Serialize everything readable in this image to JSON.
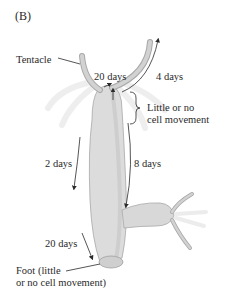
{
  "figure": {
    "panel_label": "(B)",
    "labels": {
      "tentacle": "Tentacle",
      "head_left_days": "20 days",
      "tentacle_right_days": "4 days",
      "little_movement_line1": "Little or no",
      "little_movement_line2": "cell movement",
      "body_left_days": "2 days",
      "body_right_days": "8 days",
      "lower_days": "20 days",
      "foot_line1": "Foot (little",
      "foot_line2": "or no cell movement)"
    },
    "colors": {
      "body_fill": "#dcdcdc",
      "body_shade": "#c4c4c4",
      "tentacle_fill": "#c8c8c8",
      "arrow": "#2a2a2a",
      "background": "#ffffff"
    }
  }
}
